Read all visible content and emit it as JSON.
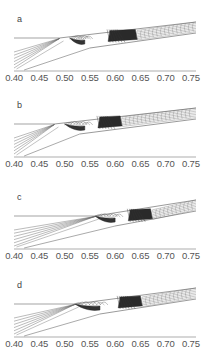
{
  "chart_data": [
    {
      "type": "line",
      "panel": "a",
      "title": "a",
      "xlabel": "",
      "ylabel": "",
      "xlim": [
        0.4,
        0.76
      ],
      "x_ticks": [
        "0.40",
        "0.45",
        "0.50",
        "0.55",
        "0.60",
        "0.65",
        "0.70",
        "0.75"
      ],
      "description": "Contour/streamline pattern: flat boundary line up to ~0.49, fan of lines from lower-left converging near 0.48-0.50, dense dark region ~0.51-0.54 and ~0.59-0.64, converging bundle of lines toward right edge"
    },
    {
      "type": "line",
      "panel": "b",
      "title": "b",
      "xlabel": "",
      "ylabel": "",
      "xlim": [
        0.4,
        0.76
      ],
      "x_ticks": [
        "0.40",
        "0.45",
        "0.50",
        "0.55",
        "0.60",
        "0.65",
        "0.70",
        "0.75"
      ],
      "description": "Contour pattern: boundary line up to ~0.48, fan lines from lower-left, dark region ~0.50-0.54 and ~0.57-0.61, bundle to right edge"
    },
    {
      "type": "line",
      "panel": "c",
      "title": "c",
      "xlabel": "",
      "ylabel": "",
      "xlim": [
        0.4,
        0.76
      ],
      "x_ticks": [
        "0.40",
        "0.45",
        "0.50",
        "0.55",
        "0.60",
        "0.65",
        "0.70",
        "0.75"
      ],
      "description": "Contour pattern: boundary line up to ~0.56, fan lines from lower-left, dark region ~0.56-0.60 and ~0.63-0.67, bundle to right edge"
    },
    {
      "type": "line",
      "panel": "d",
      "title": "d",
      "xlabel": "",
      "ylabel": "",
      "xlim": [
        0.4,
        0.76
      ],
      "x_ticks": [
        "0.40",
        "0.45",
        "0.50",
        "0.55",
        "0.60",
        "0.65",
        "0.70",
        "0.75"
      ],
      "description": "Contour pattern: boundary line up to ~0.52, fan lines from lower-left, dark region ~0.52-0.57 and ~0.61-0.65, bundle to right edge"
    }
  ],
  "panels": [
    {
      "label": "a",
      "top": 0,
      "shock_x": 0.49,
      "dark1": [
        0.51,
        0.54
      ],
      "dark2": [
        0.59,
        0.64
      ],
      "foot": 0.55
    },
    {
      "label": "b",
      "top": 86,
      "shock_x": 0.48,
      "dark1": [
        0.5,
        0.54
      ],
      "dark2": [
        0.57,
        0.61
      ],
      "foot": 0.53
    },
    {
      "label": "c",
      "top": 178,
      "shock_x": 0.56,
      "dark1": [
        0.56,
        0.6
      ],
      "dark2": [
        0.63,
        0.67
      ],
      "foot": 0.6
    },
    {
      "label": "d",
      "top": 266,
      "shock_x": 0.52,
      "dark1": [
        0.52,
        0.57
      ],
      "dark2": [
        0.61,
        0.65
      ],
      "foot": 0.57
    }
  ],
  "x_ticks": [
    "0.40",
    "0.45",
    "0.50",
    "0.55",
    "0.60",
    "0.65",
    "0.70",
    "0.75"
  ]
}
